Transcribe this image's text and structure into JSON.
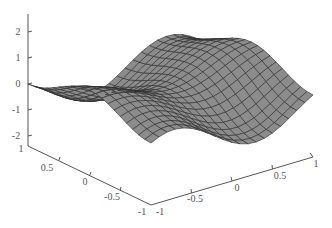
{
  "chart_data": {
    "type": "surface",
    "title": "",
    "xlabel": "",
    "ylabel": "",
    "zlabel": "",
    "x_range": [
      -1,
      1
    ],
    "y_range": [
      -1,
      1
    ],
    "z_range": [
      -2,
      2
    ],
    "grid_size": 21,
    "function_hint": "saddle-like wave surface, z ≈ sin(pi*x)*... peaks ~1.5 at back-left and back-right corners, trough near center-front",
    "axes": {
      "z": {
        "ticks": [
          "-2",
          "-1",
          "0",
          "1",
          "2"
        ]
      },
      "x_left_floor": {
        "ticks": [
          "1",
          "0.5",
          "0",
          "-0.5",
          "-1"
        ]
      },
      "y_right_floor": {
        "ticks": [
          "-1",
          "-0.5",
          "0",
          "0.5",
          "1"
        ]
      }
    },
    "grid": false,
    "legend": null,
    "colors": {
      "surface_face": "#8c8c8c",
      "surface_edge": "#2a2a2a",
      "axis": "#555555"
    }
  },
  "labels": {
    "z": [
      {
        "text": "2",
        "x": 18,
        "y": 32
      },
      {
        "text": "1",
        "x": 18,
        "y": 58
      },
      {
        "text": "0",
        "x": 18,
        "y": 84
      },
      {
        "text": "-1",
        "x": 16,
        "y": 110
      },
      {
        "text": "-2",
        "x": 16,
        "y": 136
      }
    ],
    "left_floor": [
      {
        "text": "1",
        "x": 21,
        "y": 149
      },
      {
        "text": "0.5",
        "x": 47,
        "y": 168
      },
      {
        "text": "0",
        "x": 85,
        "y": 182
      },
      {
        "text": "-0.5",
        "x": 112,
        "y": 197
      },
      {
        "text": "-1",
        "x": 142,
        "y": 212
      }
    ],
    "right_floor": [
      {
        "text": "-1",
        "x": 160,
        "y": 212
      },
      {
        "text": "-0.5",
        "x": 195,
        "y": 199
      },
      {
        "text": "0",
        "x": 237,
        "y": 188
      },
      {
        "text": "0.5",
        "x": 280,
        "y": 176
      },
      {
        "text": "1",
        "x": 316,
        "y": 164
      }
    ]
  }
}
